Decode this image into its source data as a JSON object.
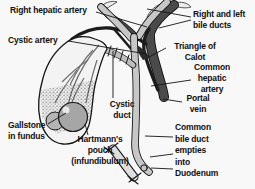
{
  "labels": {
    "right_hepatic_artery": {
      "text": "Right hepatic artery"
    },
    "cystic_artery": {
      "text": "Cystic artery"
    },
    "bile_ducts": {
      "line1": "Right and left",
      "line2": "bile ducts"
    },
    "triangle_calot": {
      "line1": "Triangle of",
      "line2": "Calot"
    },
    "common_hepatic_artery": {
      "line1": "Common",
      "line2": "hepatic",
      "line3": "artery"
    },
    "portal_vein": {
      "line1": "Portal",
      "line2": "vein"
    },
    "cystic_duct": {
      "line1": "Cystic",
      "line2": "duct"
    },
    "gallstone": {
      "line1": "Gallstone",
      "line2": "in fundus"
    },
    "hartmanns_pouch": {
      "line1": "Hartmann's",
      "line2": "pouch",
      "line3": "(infundibulum)"
    },
    "common_bile_duct": {
      "line1": "Common",
      "line2": "bile duct",
      "line3": "empties",
      "line4": "into",
      "line5": "Duodenum"
    }
  },
  "colors": {
    "background": "#f8f8f8",
    "outline": "#141414",
    "bile_duct_fill": "#c7c7c7",
    "portal_vein_fill": "#4a4a4a",
    "artery_fill": "#1c1c1c",
    "gallbladder_fill": "#f3f3f3",
    "gallstone_fill": "#a6a6a6",
    "label_text": "#101010"
  }
}
